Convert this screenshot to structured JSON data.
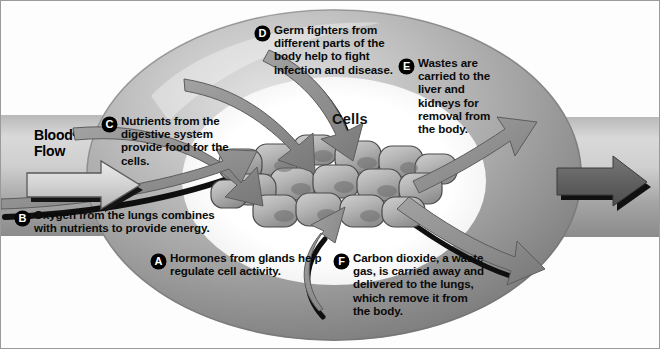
{
  "diagram": {
    "title_label": "Cells",
    "flow_label": "Blood\nFlow",
    "flow_label_line1": "Blood",
    "flow_label_line2": "Flow",
    "colors": {
      "vessel_light": "#d8d8d8",
      "vessel_mid": "#9a9a9a",
      "vessel_dark": "#6f6f6f",
      "cell_fill": "#b4b4b4",
      "arrow_gray": "#8d8d8d",
      "shadow_black": "#111111",
      "interior_white": "#ffffff",
      "text_black": "#0a0a0a",
      "badge_bg": "#000000",
      "badge_text": "#ffffff",
      "page_background": "#fdfdfd",
      "border": "#9a9a9a"
    },
    "callouts": [
      {
        "key": "A",
        "letter": "A",
        "text": "Hormones from glands help regulate cell activity.",
        "lines": [
          "Hormones from glands",
          "help regulate cell activity."
        ]
      },
      {
        "key": "B",
        "letter": "B",
        "text": "Oxygen from the lungs combines with nutrients to provide energy.",
        "lines": [
          "Oxygen from the lungs combines",
          "with nutrients to provide energy."
        ]
      },
      {
        "key": "C",
        "letter": "C",
        "text": "Nutrients from the digestive system provide food for the cells.",
        "lines": [
          "Nutrients from the",
          "digestive system",
          "provide food",
          "for the cells."
        ]
      },
      {
        "key": "D",
        "letter": "D",
        "text": "Germ fighters from different parts of the body help to fight infection and disease.",
        "lines": [
          "Germ fighters from",
          "different parts of the",
          "body help to fight",
          "infection and disease."
        ]
      },
      {
        "key": "E",
        "letter": "E",
        "text": "Wastes are carried to the liver and kidneys for removal from the body.",
        "lines": [
          "Wastes are",
          "carried to the",
          "liver and kidneys",
          "for removal from",
          "the body."
        ]
      },
      {
        "key": "F",
        "letter": "F",
        "text": "Carbon dioxide, a waste gas, is carried away and delivered to the lungs, which remove it from the body.",
        "lines": [
          "Carbon dioxide, a waste",
          "gas, is carried away and",
          "delivered to the lungs,",
          "which remove it",
          "from the body."
        ]
      }
    ]
  }
}
